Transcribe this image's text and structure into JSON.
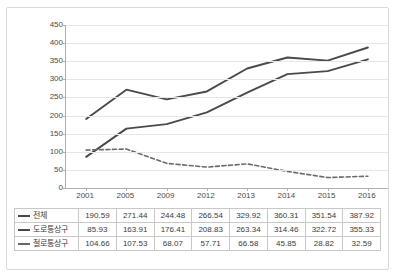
{
  "chart_data": {
    "type": "line",
    "title": "",
    "xlabel": "",
    "ylabel": "",
    "categories": [
      "2001",
      "2005",
      "2009",
      "2012",
      "2013",
      "2014",
      "2015",
      "2016"
    ],
    "ylim": [
      0,
      450
    ],
    "yticks": [
      0,
      50,
      100,
      150,
      200,
      250,
      300,
      350,
      400,
      450
    ],
    "ytick_labels": [
      "0",
      "50",
      "100",
      "150",
      "200",
      "250",
      "300",
      "350",
      "400",
      "450"
    ],
    "grid": true,
    "legend_position": "table-below",
    "series": [
      {
        "name": "전체",
        "style": "solid",
        "color": "#4a4a4a",
        "values": [
          190.59,
          271.44,
          244.48,
          266.54,
          329.92,
          360.31,
          351.54,
          387.92
        ],
        "value_labels": [
          "190.59",
          "271.44",
          "244.48",
          "266.54",
          "329.92",
          "360.31",
          "351.54",
          "387.92"
        ]
      },
      {
        "name": "도로통상구",
        "style": "solid",
        "color": "#4a4a4a",
        "values": [
          85.93,
          163.91,
          176.41,
          208.83,
          263.34,
          314.46,
          322.72,
          355.33
        ],
        "value_labels": [
          "85.93",
          "163.91",
          "176.41",
          "208.83",
          "263.34",
          "314.46",
          "322.72",
          "355.33"
        ]
      },
      {
        "name": "철로통상구",
        "style": "dashed",
        "color": "#6a6a6a",
        "values": [
          104.66,
          107.53,
          68.07,
          57.71,
          66.58,
          45.85,
          28.82,
          32.59
        ],
        "value_labels": [
          "104.66",
          "107.53",
          "68.07",
          "57.71",
          "66.58",
          "45.85",
          "28.82",
          "32.59"
        ]
      }
    ]
  },
  "colors": {
    "line_primary": "#4a4a4a",
    "line_dashed": "#6a6a6a",
    "gridline": "#e6e6e6",
    "axis": "#b0b0b0",
    "table_border": "#c8c8c8",
    "frame_border": "#d9d9d9",
    "text": "#3a3a3a"
  }
}
